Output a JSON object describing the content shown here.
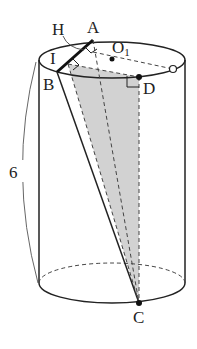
{
  "figure": {
    "type": "cylinder-geometry",
    "height_label": "6",
    "points": {
      "A": {
        "label": "A"
      },
      "B": {
        "label": "B"
      },
      "C": {
        "label": "C"
      },
      "D": {
        "label": "D"
      },
      "H": {
        "label": "H"
      },
      "I": {
        "label": "I"
      },
      "O1": {
        "label": "O",
        "subscript": "1"
      }
    },
    "colors": {
      "stroke": "#222222",
      "shade": "#cfcfcf"
    }
  }
}
